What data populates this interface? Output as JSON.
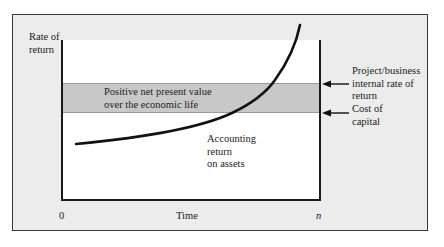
{
  "diagram": {
    "y_axis_label": "Rate of\nreturn",
    "x_axis_label": "Time",
    "x_tick_start": "0",
    "x_tick_end": "n",
    "band_label": "Positive net present value\nover the economic life",
    "curve_label": "Accounting\nreturn\non assets",
    "upper_line_label": "Project/business\ninternal rate of\nreturn",
    "lower_line_label": "Cost of\ncapital",
    "colors": {
      "frame_background": "#ececec",
      "plot_background": "#ffffff",
      "band_fill": "#c8c8c8",
      "line": "#1a1a1a"
    }
  }
}
